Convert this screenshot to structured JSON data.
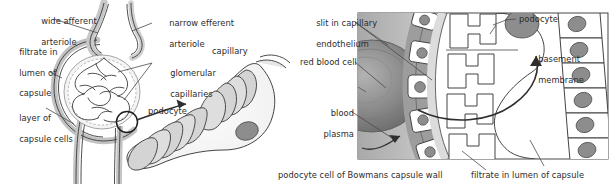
{
  "figure": {
    "colors": {
      "outline": "#3a3a3a",
      "leader": "#4a4a4a",
      "text": "#2b2b2b",
      "tissue_light": "#e3e3e3",
      "tissue_mid": "#c9c9c9",
      "tissue_dark": "#9a9a9a",
      "nucleus": "#8d8d8d",
      "rbc_dark": "#6f6f6f",
      "background": "#ffffff"
    }
  },
  "left_panel": {
    "name": "bowmans-capsule-overview",
    "labels": [
      {
        "id": "wide-afferent-arteriole",
        "line1": "wide afferent",
        "line2": "arteriole",
        "align": "left"
      },
      {
        "id": "narrow-efferent-arteriole",
        "line1": "narrow efferent",
        "line2": "arteriole",
        "align": "left"
      },
      {
        "id": "filtrate-in-lumen-of-capsule",
        "line1": "filtrate in",
        "line2": "lumen of",
        "line3": "capsule",
        "align": "left"
      },
      {
        "id": "glomerular-capillaries",
        "line1": "glomerular",
        "line2": "capillaries",
        "align": "left"
      },
      {
        "id": "layer-of-capsule-cells",
        "line1": "layer of",
        "line2": "capsule cells",
        "align": "left"
      }
    ]
  },
  "middle_panel": {
    "name": "podocyte-closeup",
    "labels": [
      {
        "id": "capillary",
        "text": "capillary"
      },
      {
        "id": "podocyte",
        "text": "podocyte"
      }
    ]
  },
  "right_panel": {
    "name": "capillary-wall-ultrastructure",
    "labels": [
      {
        "id": "slit-in-capillary-endothelium",
        "line1": "slit in capillary",
        "line2": "endothelium",
        "align": "right"
      },
      {
        "id": "red-blood-cell",
        "text": "red blood cell",
        "align": "right"
      },
      {
        "id": "blood-plasma",
        "line1": "blood",
        "line2": "plasma",
        "align": "right"
      },
      {
        "id": "podocyte",
        "text": "podocyte",
        "align": "left"
      },
      {
        "id": "basement-membrane",
        "line1": "basement",
        "line2": "membrane",
        "align": "left"
      },
      {
        "id": "podocyte-cell-of-bowmans-capsule-wall",
        "text": "podocyte cell of Bowmans capsule wall",
        "align": "left"
      },
      {
        "id": "filtrate-in-lumen-of-capsule",
        "text": "filtrate in lumen of capsule",
        "align": "left"
      }
    ]
  }
}
